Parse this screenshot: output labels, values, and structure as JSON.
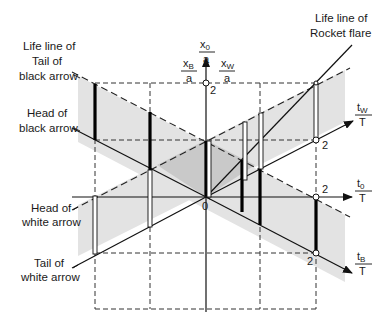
{
  "labels": {
    "life_line_black_tail_1": "Life line of",
    "life_line_black_tail_2": "Tail of",
    "life_line_black_tail_3": "black arrow",
    "head_black_1": "Head of",
    "head_black_2": "black arrow",
    "head_white_1": "Head of",
    "head_white_2": "white arrow",
    "tail_white_1": "Tail of",
    "tail_white_2": "white arrow",
    "rocket_1": "Life line of",
    "rocket_2": "Rocket flare"
  },
  "axes": {
    "x0": {
      "num": "x",
      "sub": "0",
      "den": "a"
    },
    "xB": {
      "num": "x",
      "sub": "B",
      "den": "a"
    },
    "xW": {
      "num": "x",
      "sub": "W",
      "den": "a"
    },
    "tW": {
      "num": "t",
      "sub": "W",
      "den": "T"
    },
    "t0": {
      "num": "t",
      "sub": "0",
      "den": "T"
    },
    "tB": {
      "num": "t",
      "sub": "B",
      "den": "T"
    }
  },
  "ticks": {
    "origin": "0",
    "x0_2": "2",
    "tW_2": "2",
    "t0_2": "2",
    "tB_2": "2"
  },
  "colors": {
    "shade_light": "#e2e2e2",
    "shade_dark": "#c8c8c8",
    "line": "#111111",
    "background": "#ffffff"
  }
}
